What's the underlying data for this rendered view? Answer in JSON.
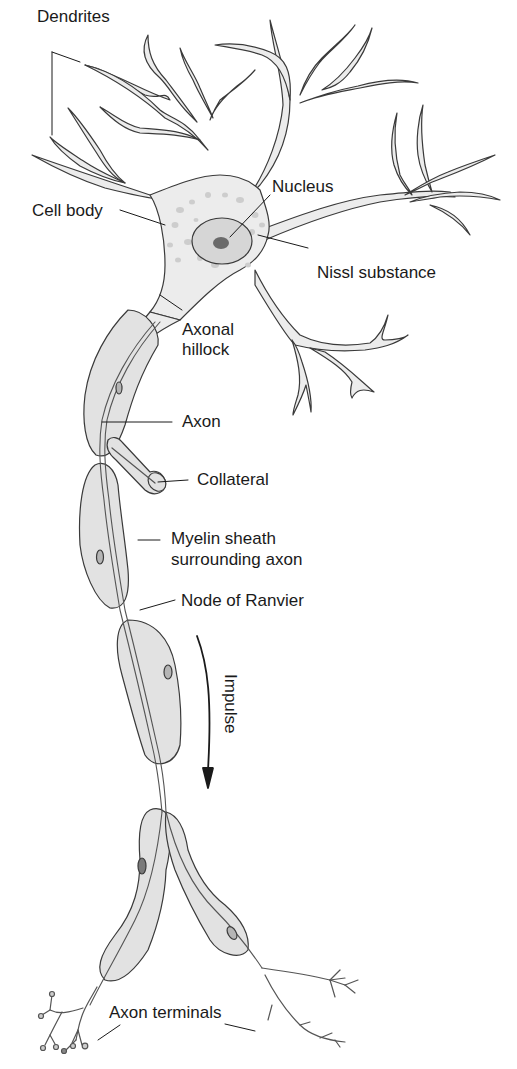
{
  "diagram": {
    "colors": {
      "cell_fill": "#ececec",
      "myelin_fill": "#e2e2e2",
      "outline": "#3a3a3a",
      "nucleus_fill": "#c9c9c9",
      "nucleolus_fill": "#6a6a6a",
      "nissl_fill": "#cdcdcd",
      "text": "#1a1a1a"
    },
    "labels": {
      "dendrites": "Dendrites",
      "cell_body": "Cell body",
      "nucleus": "Nucleus",
      "nissl_substance": "Nissl substance",
      "axonal_hillock_line1": "Axonal",
      "axonal_hillock_line2": "hillock",
      "axon": "Axon",
      "collateral": "Collateral",
      "myelin_line1": "Myelin sheath",
      "myelin_line2": "surrounding axon",
      "node_of_ranvier": "Node of Ranvier",
      "impulse": "Impulse",
      "axon_terminals": "Axon terminals"
    }
  }
}
